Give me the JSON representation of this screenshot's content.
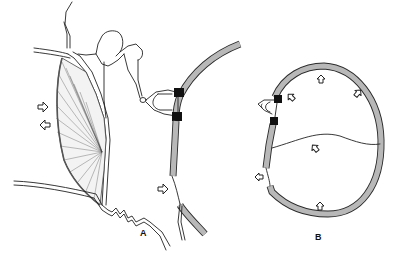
{
  "figure": {
    "panels": [
      {
        "id": "A",
        "label": "A",
        "contents": [
          "tympanic-membrane",
          "ossicular-chain",
          "curved-wall-with-window",
          "membrane-window",
          "open-arrows"
        ]
      },
      {
        "id": "B",
        "label": "B",
        "contents": [
          "oval-chamber-wall",
          "internal-partition",
          "window-membrane",
          "open-arrows"
        ]
      }
    ],
    "arrows": {
      "panel_a": [
        {
          "name": "arrow-right-upper",
          "direction": "right"
        },
        {
          "name": "arrow-left-lower",
          "direction": "left"
        },
        {
          "name": "arrow-right-window",
          "direction": "right"
        }
      ],
      "panel_b": [
        {
          "name": "arrow-up-top",
          "direction": "up"
        },
        {
          "name": "arrow-left-top",
          "direction": "up-left"
        },
        {
          "name": "arrow-up-right",
          "direction": "up-right"
        },
        {
          "name": "arrow-center",
          "direction": "up-left"
        },
        {
          "name": "arrow-left-outside",
          "direction": "left"
        },
        {
          "name": "arrow-bottom",
          "direction": "up"
        }
      ]
    },
    "colors": {
      "line": "#222222",
      "wall_fill": "#b8b8b8",
      "ligament": "#111111",
      "background": "#ffffff"
    }
  }
}
